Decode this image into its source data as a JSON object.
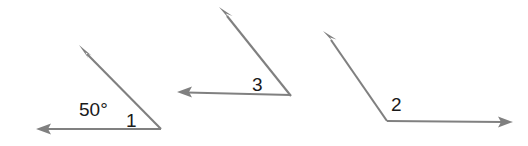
{
  "figure": {
    "background_color": "#ffffff",
    "stroke_color": "#808080",
    "text_color": "#1a1a1a",
    "width": 528,
    "height": 146
  },
  "angles": [
    {
      "id": "angle-1",
      "label": "1",
      "label_x": 126,
      "label_y": 127,
      "measure_text": "50°",
      "measure_x": 79,
      "measure_y": 116,
      "vertex_x": 161,
      "vertex_y": 129,
      "ray_horizontal": {
        "tip_x": 36,
        "tip_y": 129,
        "direction": "left"
      },
      "ray_diagonal": {
        "tip_x": 79,
        "tip_y": 45,
        "direction": "up-left"
      }
    },
    {
      "id": "angle-3",
      "label": "3",
      "label_x": 252,
      "label_y": 91,
      "measure_text": "",
      "vertex_x": 291,
      "vertex_y": 96,
      "ray_horizontal": {
        "tip_x": 177,
        "tip_y": 92,
        "direction": "left"
      },
      "ray_diagonal": {
        "tip_x": 219,
        "tip_y": 7,
        "direction": "up-left"
      }
    },
    {
      "id": "angle-2",
      "label": "2",
      "label_x": 391,
      "label_y": 111,
      "measure_text": "",
      "vertex_x": 387,
      "vertex_y": 121,
      "ray_horizontal": {
        "tip_x": 513,
        "tip_y": 122,
        "direction": "right"
      },
      "ray_diagonal": {
        "tip_x": 323,
        "tip_y": 31,
        "direction": "up-left"
      }
    }
  ],
  "labels": {
    "angle_one": "1",
    "angle_two": "2",
    "angle_three": "3",
    "measure_fifty": "50°"
  }
}
